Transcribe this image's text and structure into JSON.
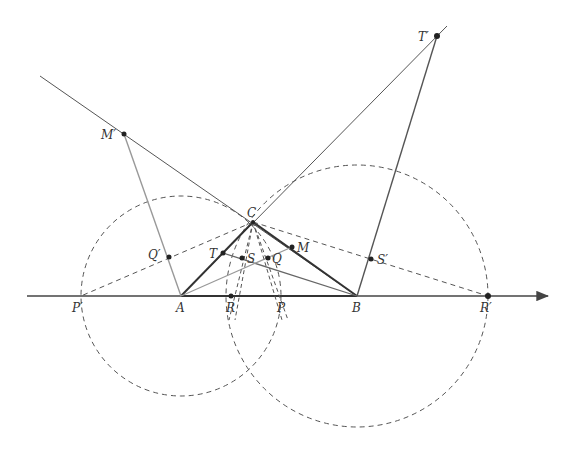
{
  "diagram": {
    "type": "geometric-construction",
    "colors": {
      "dark_line": "#444444",
      "light_line": "#999999",
      "dashed": "#555555",
      "point": "#222222",
      "background": "#ffffff"
    },
    "points": {
      "A": {
        "label": "A",
        "x": 181,
        "y": 296
      },
      "B": {
        "label": "B",
        "x": 357,
        "y": 296
      },
      "C": {
        "label": "C",
        "x": 253,
        "y": 222
      },
      "R": {
        "label": "R",
        "x": 231,
        "y": 296
      },
      "P": {
        "label": "P",
        "x": 282,
        "y": 296
      },
      "Pp": {
        "label": "P′",
        "x": 81,
        "y": 296
      },
      "Rp": {
        "label": "R′",
        "x": 488,
        "y": 296
      },
      "T": {
        "label": "T",
        "x": 223,
        "y": 253
      },
      "S": {
        "label": "S",
        "x": 242,
        "y": 258
      },
      "Q": {
        "label": "Q",
        "x": 268,
        "y": 258
      },
      "M": {
        "label": "M",
        "x": 292,
        "y": 247
      },
      "Mp": {
        "label": "M′",
        "x": 124,
        "y": 134
      },
      "Qp": {
        "label": "Q′",
        "x": 169,
        "y": 257
      },
      "Sp": {
        "label": "S′",
        "x": 371,
        "y": 259
      },
      "Tp": {
        "label": "T′",
        "x": 437,
        "y": 36
      }
    },
    "labels": {
      "A": "A",
      "B": "B",
      "C": "C",
      "R": "R",
      "P": "P",
      "Pp": "P′",
      "Rp": "R′",
      "T": "T",
      "S": "S",
      "Q": "Q",
      "M": "M",
      "Mp": "M′",
      "Qp": "Q′",
      "Sp": "S′",
      "Tp": "T′"
    },
    "axis": {
      "x1": 27,
      "x2": 548,
      "y": 296,
      "arrow": "right"
    },
    "circles": [
      {
        "name": "circle-centered-A",
        "cx": 181,
        "cy": 296,
        "r": 100,
        "style": "dashed"
      },
      {
        "name": "circle-centered-B",
        "cx": 357,
        "cy": 296,
        "r": 131,
        "style": "dashed"
      }
    ]
  }
}
